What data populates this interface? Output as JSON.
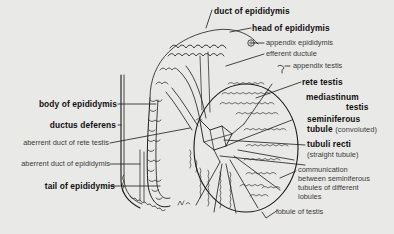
{
  "diagram": {
    "colors": {
      "background": "#e9e9e7",
      "ink": "#1a1a1a",
      "light_label": "#3a3a3a"
    },
    "labels": {
      "duct_of_epididymis": "duct of epididymis",
      "head_of_epididymis": "head of epididymis",
      "appendix_epididymis": "appendix epididymis",
      "efferent_ductule": "efferent ductule",
      "appendix_testis": "appendix testis",
      "rete_testis": "rete testis",
      "mediastinum_testis_line1": "mediastinum",
      "mediastinum_testis_line2": "testis",
      "seminiferous_tubule_line1": "seminiferous",
      "seminiferous_tubule_line2": "tubule",
      "seminiferous_tubule_note": "(convoluted)",
      "tubuli_recti": "tubuli recti",
      "tubuli_recti_note": "(straight tubule)",
      "communication_line1": "communication",
      "communication_line2": "between seminiferous",
      "communication_line3": "tubules of different",
      "communication_line4": "lobules",
      "lobule_of_testis": "lobule of testis",
      "body_of_epididymis": "body of epididymis",
      "ductus_deferens": "ductus deferens",
      "aberrent_duct_of_rete_testis": "aberrent duct of rete testis",
      "aberrent_duct_of_epididymis": "aberrent duct of epididymis",
      "tail_of_epididymis": "tail of epididymis"
    },
    "artist_signature": "MJL"
  }
}
